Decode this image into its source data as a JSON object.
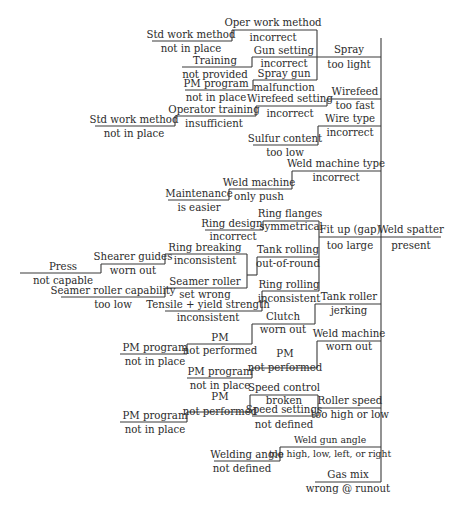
{
  "diagram": {
    "type": "fault-tree / cause-and-effect",
    "effect": {
      "title": "Weld spatter",
      "state": "present"
    },
    "causes": [
      {
        "title": "Spray",
        "state": "too light"
      },
      {
        "title": "Wirefeed",
        "state": "too fast"
      },
      {
        "title": "Wire type",
        "state": "incorrect"
      },
      {
        "title": "Weld machine type",
        "state": "incorrect"
      },
      {
        "title": "Fit up (gap)",
        "state": "too large"
      },
      {
        "title": "Tank roller",
        "state": "jerking"
      },
      {
        "title": "Weld machine",
        "state": "worn out"
      },
      {
        "title": "Roller speed",
        "state": "too high or low"
      },
      {
        "title": "Weld gun angle",
        "state": "too high, low, left, or right"
      },
      {
        "title": "Gas mix",
        "state": "wrong @ runout"
      }
    ],
    "nodes": {
      "oper_work_method": {
        "title": "Oper work method",
        "state": "incorrect"
      },
      "std_work_method_1": {
        "title": "Std work method",
        "state": "not in place"
      },
      "gun_setting": {
        "title": "Gun setting",
        "state": "incorrect"
      },
      "training": {
        "title": "Training",
        "state": "not provided"
      },
      "spray_gun": {
        "title": "Spray gun",
        "state": "malfunction"
      },
      "pm_program_1": {
        "title": "PM program",
        "state": "not in place"
      },
      "wirefeed_setting": {
        "title": "Wirefeed setting",
        "state": "incorrect"
      },
      "operator_training": {
        "title": "Operator training",
        "state": "insufficient"
      },
      "std_work_method_2": {
        "title": "Std work method",
        "state": "not in place"
      },
      "sulfur_content": {
        "title": "Sulfur content",
        "state": "too low"
      },
      "weld_machine_push": {
        "title": "Weld machine",
        "state": "only push"
      },
      "maintenance": {
        "title": "Maintenance",
        "state": "is easier"
      },
      "ring_flanges": {
        "title": "Ring flanges",
        "state": "symmetrical"
      },
      "ring_design": {
        "title": "Ring design",
        "state": "incorrect"
      },
      "ring_breaking": {
        "title": "Ring breaking",
        "state": "inconsistent"
      },
      "shearer_guides": {
        "title": "Shearer guides",
        "state": "worn out"
      },
      "press": {
        "title": "Press",
        "state": "not capable"
      },
      "tank_rolling": {
        "title": "Tank rolling",
        "state": "out-of-round"
      },
      "seamer_roller": {
        "title": "Seamer roller",
        "state": "set wrong"
      },
      "seamer_roller_capability": {
        "title": "Seamer roller capability",
        "state": "too low"
      },
      "ring_rolling": {
        "title": "Ring rolling",
        "state": "inconsistent"
      },
      "tensile_yield": {
        "title": "Tensile + yield strength",
        "state": "inconsistent"
      },
      "clutch": {
        "title": "Clutch",
        "state": "worn out"
      },
      "pm_1": {
        "title": "PM",
        "state": "not performed"
      },
      "pm_program_2": {
        "title": "PM program",
        "state": "not in place"
      },
      "pm_2": {
        "title": "PM",
        "state": "not performed"
      },
      "pm_program_3": {
        "title": "PM program",
        "state": "not in place"
      },
      "speed_control": {
        "title": "Speed control",
        "state": "broken"
      },
      "speed_settings": {
        "title": "Speed settings",
        "state": "not defined"
      },
      "pm_3": {
        "title": "PM",
        "state": "not performed"
      },
      "pm_program_4": {
        "title": "PM program",
        "state": "not in place"
      },
      "welding_angle": {
        "title": "Welding angle",
        "state": "not defined"
      }
    }
  },
  "colors": {
    "line": "#3a3a3a",
    "text": "#2b2b2b",
    "background": "#ffffff"
  }
}
